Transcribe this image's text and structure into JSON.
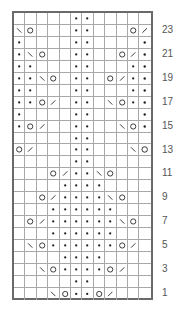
{
  "chart": {
    "columns": 12,
    "rows": 24,
    "legend_symbols": {
      "dot": "purl",
      "O": "yarn-over",
      "/": "k2tog",
      "\\": "ssk",
      "": "knit"
    },
    "grid_rows_top_to_bottom": [
      {
        "row": 24,
        "cells": [
          "",
          "",
          "",
          "",
          "",
          "dot",
          "dot",
          "",
          "",
          "",
          "",
          ""
        ]
      },
      {
        "row": 23,
        "cells": [
          "\\",
          "O",
          "",
          "",
          "",
          "dot",
          "dot",
          "",
          "",
          "",
          "O",
          "/"
        ]
      },
      {
        "row": 22,
        "cells": [
          "dot",
          "",
          "",
          "",
          "",
          "dot",
          "dot",
          "",
          "",
          "",
          "",
          "dot"
        ]
      },
      {
        "row": 21,
        "cells": [
          "dot",
          "\\",
          "O",
          "",
          "",
          "dot",
          "dot",
          "",
          "",
          "O",
          "/",
          "dot"
        ]
      },
      {
        "row": 20,
        "cells": [
          "dot",
          "dot",
          "",
          "",
          "",
          "dot",
          "dot",
          "",
          "",
          "",
          "dot",
          "dot"
        ]
      },
      {
        "row": 19,
        "cells": [
          "dot",
          "dot",
          "\\",
          "O",
          "",
          "dot",
          "dot",
          "",
          "O",
          "/",
          "dot",
          "dot"
        ]
      },
      {
        "row": 18,
        "cells": [
          "dot",
          "dot",
          "",
          "",
          "",
          "dot",
          "dot",
          "",
          "",
          "",
          "dot",
          "dot"
        ]
      },
      {
        "row": 17,
        "cells": [
          "dot",
          "dot",
          "O",
          "/",
          "",
          "dot",
          "dot",
          "",
          "\\",
          "O",
          "dot",
          "dot"
        ]
      },
      {
        "row": 16,
        "cells": [
          "dot",
          "",
          "",
          "",
          "",
          "dot",
          "dot",
          "",
          "",
          "",
          "",
          "dot"
        ]
      },
      {
        "row": 15,
        "cells": [
          "dot",
          "O",
          "/",
          "",
          "",
          "dot",
          "dot",
          "",
          "",
          "\\",
          "O",
          "dot"
        ]
      },
      {
        "row": 14,
        "cells": [
          "",
          "",
          "",
          "",
          "",
          "dot",
          "dot",
          "",
          "",
          "",
          "",
          ""
        ]
      },
      {
        "row": 13,
        "cells": [
          "O",
          "/",
          "",
          "",
          "",
          "dot",
          "dot",
          "",
          "",
          "",
          "\\",
          "O"
        ]
      },
      {
        "row": 12,
        "cells": [
          "",
          "",
          "",
          "",
          "",
          "dot",
          "dot",
          "",
          "",
          "",
          "",
          ""
        ]
      },
      {
        "row": 11,
        "cells": [
          "",
          "",
          "",
          "O",
          "/",
          "dot",
          "dot",
          "\\",
          "O",
          "",
          "",
          ""
        ]
      },
      {
        "row": 10,
        "cells": [
          "",
          "",
          "",
          "",
          "dot",
          "dot",
          "dot",
          "dot",
          "",
          "",
          "",
          ""
        ]
      },
      {
        "row": 9,
        "cells": [
          "",
          "",
          "O",
          "/",
          "dot",
          "dot",
          "dot",
          "dot",
          "\\",
          "O",
          "",
          ""
        ]
      },
      {
        "row": 8,
        "cells": [
          "",
          "",
          "",
          "dot",
          "dot",
          "dot",
          "dot",
          "dot",
          "dot",
          "",
          "",
          ""
        ]
      },
      {
        "row": 7,
        "cells": [
          "",
          "O",
          "/",
          "dot",
          "dot",
          "dot",
          "dot",
          "dot",
          "dot",
          "\\",
          "O",
          ""
        ]
      },
      {
        "row": 6,
        "cells": [
          "",
          "",
          "",
          "dot",
          "dot",
          "dot",
          "dot",
          "dot",
          "dot",
          "",
          "",
          ""
        ]
      },
      {
        "row": 5,
        "cells": [
          "",
          "\\",
          "O",
          "dot",
          "dot",
          "dot",
          "dot",
          "dot",
          "dot",
          "O",
          "/",
          ""
        ]
      },
      {
        "row": 4,
        "cells": [
          "",
          "",
          "",
          "",
          "dot",
          "dot",
          "dot",
          "dot",
          "",
          "",
          "",
          ""
        ]
      },
      {
        "row": 3,
        "cells": [
          "",
          "",
          "\\",
          "O",
          "dot",
          "dot",
          "dot",
          "dot",
          "O",
          "/",
          "",
          ""
        ]
      },
      {
        "row": 2,
        "cells": [
          "",
          "",
          "",
          "",
          "",
          "dot",
          "dot",
          "",
          "",
          "",
          "",
          ""
        ]
      },
      {
        "row": 1,
        "cells": [
          "",
          "",
          "",
          "\\",
          "O",
          "dot",
          "dot",
          "O",
          "/",
          "",
          "",
          ""
        ]
      }
    ],
    "row_labels": [
      "23",
      "21",
      "19",
      "17",
      "15",
      "13",
      "11",
      "9",
      "7",
      "5",
      "3",
      "1"
    ],
    "colors": {
      "border": "#6a6a6a",
      "gridline": "#a8a8a8",
      "symbol": "#222222",
      "label": "#555555"
    }
  }
}
